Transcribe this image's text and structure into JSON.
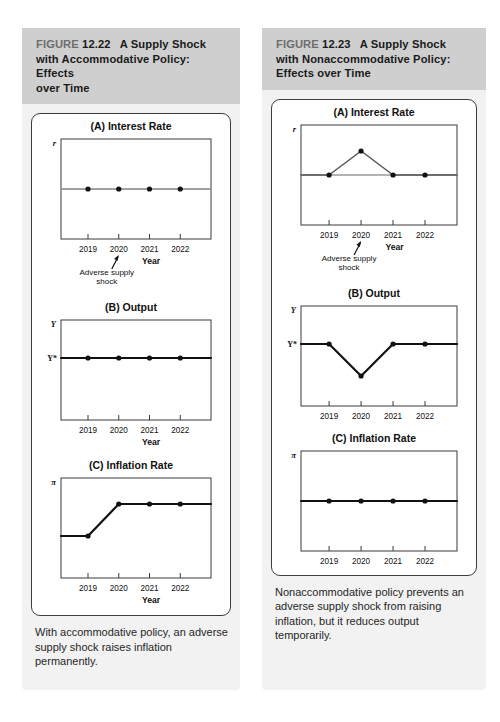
{
  "page": {
    "background": "#ffffff",
    "panel_background": "#f2f2f2",
    "header_background": "#cfcfcf",
    "ink": "#111111",
    "gray_line": "#9a9a9a"
  },
  "panels": [
    {
      "id": "left",
      "header": {
        "figure_word": "FIGURE",
        "number": "12.22",
        "title": "A Supply Shock with Accommodative Policy: Effects over Time",
        "line1": "FIGURE 12.22  A Supply Shock",
        "line2": "with Accommodative Policy: Effects",
        "line3": "over Time"
      },
      "caption": "With accommodative policy, an adverse supply shock raises inflation permanently.",
      "charts": [
        {
          "panel_label": "(A) Interest Rate",
          "y_axis_symbol": "r",
          "x_axis_label": "Year",
          "annotation": "Adverse supply shock",
          "annotation_target_year": "2020",
          "has_reference_line": true,
          "reference_line_color": "#9a9a9a",
          "series_color": "#9a9a9a",
          "categories": [
            "2019",
            "2020",
            "2021",
            "2022"
          ],
          "values": [
            0.5,
            0.5,
            0.5,
            0.5
          ]
        },
        {
          "panel_label": "(B) Output",
          "y_axis_symbol": "Y",
          "y_reference_label": "Y*",
          "x_axis_label": "Year",
          "annotation": "",
          "has_reference_line": false,
          "series_color": "#111111",
          "categories": [
            "2019",
            "2020",
            "2021",
            "2022"
          ],
          "values": [
            0.62,
            0.62,
            0.62,
            0.62
          ]
        },
        {
          "panel_label": "(C) Inflation Rate",
          "y_axis_symbol": "π",
          "x_axis_label": "Year",
          "annotation": "",
          "has_reference_line": false,
          "series_color": "#111111",
          "categories": [
            "2019",
            "2020",
            "2021",
            "2022"
          ],
          "values": [
            0.42,
            0.74,
            0.74,
            0.74
          ]
        }
      ]
    },
    {
      "id": "right",
      "header": {
        "figure_word": "FIGURE",
        "number": "12.23",
        "title": "A Supply Shock with Nonaccommodative Policy: Effects over Time",
        "line1": "FIGURE 12.23  A Supply Shock",
        "line2": "with Nonaccommodative Policy:",
        "line3": "Effects over Time"
      },
      "caption": "Nonaccommodative policy prevents an adverse supply shock from raising inflation, but it reduces output temporarily.",
      "charts": [
        {
          "panel_label": "(A) Interest Rate",
          "y_axis_symbol": "r",
          "x_axis_label": "Year",
          "annotation": "Adverse supply shock",
          "annotation_target_year": "2020",
          "has_reference_line": true,
          "reference_line_color": "#9a9a9a",
          "series_color": "#555555",
          "categories": [
            "2019",
            "2020",
            "2021",
            "2022"
          ],
          "values": [
            0.5,
            0.74,
            0.5,
            0.5
          ]
        },
        {
          "panel_label": "(B) Output",
          "y_axis_symbol": "Y",
          "y_reference_label": "Y*",
          "x_axis_label": "",
          "annotation": "",
          "has_reference_line": false,
          "series_color": "#111111",
          "categories": [
            "2019",
            "2020",
            "2021",
            "2022"
          ],
          "values": [
            0.62,
            0.3,
            0.62,
            0.62
          ]
        },
        {
          "panel_label": "(C) Inflation Rate",
          "y_axis_symbol": "π",
          "x_axis_label": "",
          "annotation": "",
          "has_reference_line": false,
          "series_color": "#111111",
          "categories": [
            "2019",
            "2020",
            "2021",
            "2022"
          ],
          "values": [
            0.5,
            0.5,
            0.5,
            0.5
          ]
        }
      ]
    }
  ],
  "chart_data": [
    {
      "type": "line",
      "title": "FIGURE 12.22 (A) Interest Rate",
      "xlabel": "Year",
      "ylabel": "r",
      "categories": [
        "2019",
        "2020",
        "2021",
        "2022"
      ],
      "values": [
        0.5,
        0.5,
        0.5,
        0.5
      ],
      "note": "Interest rate stays flat at its initial level under accommodative policy",
      "annotation": "Adverse supply shock (at 2020)",
      "grid": false,
      "legend": "none"
    },
    {
      "type": "line",
      "title": "FIGURE 12.22 (B) Output",
      "xlabel": "Year",
      "ylabel": "Y",
      "categories": [
        "2019",
        "2020",
        "2021",
        "2022"
      ],
      "values": [
        0.62,
        0.62,
        0.62,
        0.62
      ],
      "note": "Output remains at potential Y* throughout",
      "grid": false,
      "legend": "none"
    },
    {
      "type": "line",
      "title": "FIGURE 12.22 (C) Inflation Rate",
      "xlabel": "Year",
      "ylabel": "π",
      "categories": [
        "2019",
        "2020",
        "2021",
        "2022"
      ],
      "values": [
        0.42,
        0.74,
        0.74,
        0.74
      ],
      "note": "Inflation rises between 2019 and 2020 then stays permanently higher",
      "grid": false,
      "legend": "none"
    },
    {
      "type": "line",
      "title": "FIGURE 12.23 (A) Interest Rate",
      "xlabel": "Year",
      "ylabel": "r",
      "categories": [
        "2019",
        "2020",
        "2021",
        "2022"
      ],
      "values": [
        0.5,
        0.74,
        0.5,
        0.5
      ],
      "note": "Interest rate spikes at 2020 then returns to its initial level",
      "annotation": "Adverse supply shock (at 2020)",
      "grid": false,
      "legend": "none"
    },
    {
      "type": "line",
      "title": "FIGURE 12.23 (B) Output",
      "xlabel": "",
      "ylabel": "Y",
      "categories": [
        "2019",
        "2020",
        "2021",
        "2022"
      ],
      "values": [
        0.62,
        0.3,
        0.62,
        0.62
      ],
      "note": "Output dips below potential Y* at 2020 then recovers",
      "grid": false,
      "legend": "none"
    },
    {
      "type": "line",
      "title": "FIGURE 12.23 (C) Inflation Rate",
      "xlabel": "",
      "ylabel": "π",
      "categories": [
        "2019",
        "2020",
        "2021",
        "2022"
      ],
      "values": [
        0.5,
        0.5,
        0.5,
        0.5
      ],
      "note": "Inflation remains constant",
      "grid": false,
      "legend": "none"
    }
  ]
}
